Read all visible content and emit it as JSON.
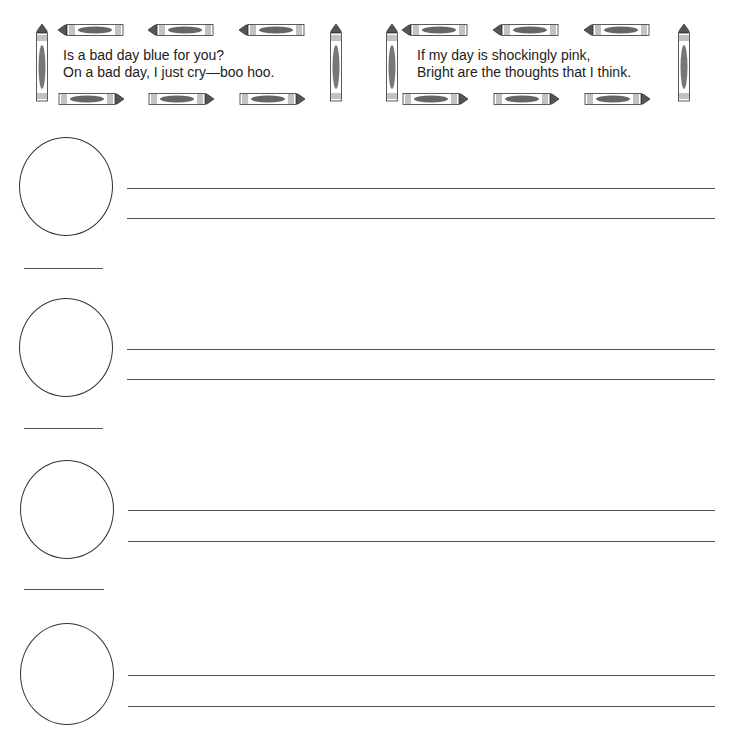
{
  "poems": [
    {
      "lines": [
        "Is a bad day blue for you?",
        "On a bad day, I just cry—boo hoo."
      ]
    },
    {
      "lines": [
        "If my day is shockingly pink,",
        "Bright are the thoughts that I think."
      ]
    }
  ],
  "rows": [
    {
      "circle_top": 137,
      "line1": 188,
      "line2": 218,
      "short_line": 268
    },
    {
      "circle_top": 298,
      "line1": 349,
      "line2": 379,
      "short_line": 428
    },
    {
      "circle_top": 460,
      "line1": 510,
      "line2": 541,
      "short_line": 589
    },
    {
      "circle_top": 623,
      "line1": 675,
      "line2": 706,
      "short_line": null
    }
  ],
  "colors": {
    "crayon_dark": "#555555",
    "crayon_mid": "#888888",
    "outline": "#333333"
  }
}
